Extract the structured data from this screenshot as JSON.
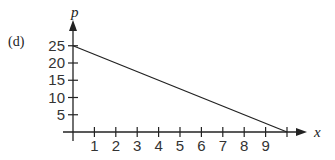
{
  "panel_label": "(d)",
  "chart_data": {
    "type": "line",
    "title": "",
    "panel": "(d)",
    "xlabel": "x",
    "ylabel": "p",
    "x_ticks": [
      1,
      2,
      3,
      4,
      5,
      6,
      7,
      8,
      9,
      10
    ],
    "x_tick_labels": [
      "1",
      "2",
      "3",
      "4",
      "5",
      "6",
      "7",
      "8",
      "9",
      ""
    ],
    "y_ticks": [
      5,
      10,
      15,
      20,
      25
    ],
    "y_tick_labels": [
      "5",
      "10",
      "15",
      "20",
      "25"
    ],
    "xlim": [
      0,
      10.8
    ],
    "ylim": [
      0,
      28
    ],
    "grid": false,
    "legend": null,
    "series": [
      {
        "name": "p",
        "x": [
          0,
          10
        ],
        "y": [
          25,
          0
        ]
      }
    ]
  }
}
